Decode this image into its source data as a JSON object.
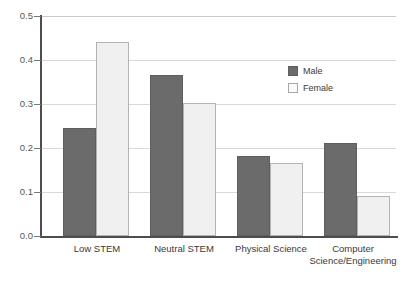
{
  "chart_data": {
    "type": "bar",
    "title": "",
    "subtitle": "",
    "xlabel": "",
    "ylabel": "",
    "categories": [
      "Low STEM",
      "Neutral STEM",
      "Physical Science",
      "Computer Science/Engineering"
    ],
    "series": [
      {
        "name": "Male",
        "color": "#6b6b6b",
        "values": [
          0.245,
          0.367,
          0.182,
          0.212
        ]
      },
      {
        "name": "Female",
        "color": "#f0f0f0",
        "values": [
          0.44,
          0.303,
          0.167,
          0.09
        ]
      }
    ],
    "ylim": [
      0.0,
      0.5
    ],
    "yticks": [
      "0.0",
      "0.1",
      "0.2",
      "0.3",
      "0.4",
      "0.5"
    ],
    "ytick_values": [
      0.0,
      0.1,
      0.2,
      0.3,
      0.4,
      0.5
    ],
    "grid": true,
    "grid_axis": "y",
    "legend_position": "upper right",
    "legend": [
      "Male",
      "Female"
    ]
  },
  "axes": {
    "y": {
      "ticks": [
        {
          "label": "0.5",
          "value": 0.5
        },
        {
          "label": "0.4",
          "value": 0.4
        },
        {
          "label": "0.3",
          "value": 0.3
        },
        {
          "label": "0.2",
          "value": 0.2
        },
        {
          "label": "0.1",
          "value": 0.1
        },
        {
          "label": "0.0",
          "value": 0.0
        }
      ]
    },
    "x": {
      "labels": [
        {
          "line1": "Low STEM",
          "line2": ""
        },
        {
          "line1": "Neutral STEM",
          "line2": ""
        },
        {
          "line1": "Physical Science",
          "line2": ""
        },
        {
          "line1": "Computer",
          "line2": "Science/Engineering"
        }
      ]
    }
  },
  "legend": {
    "items": [
      {
        "label": "Male",
        "swatch": "male-swatch"
      },
      {
        "label": "Female",
        "swatch": "female-swatch"
      }
    ]
  }
}
